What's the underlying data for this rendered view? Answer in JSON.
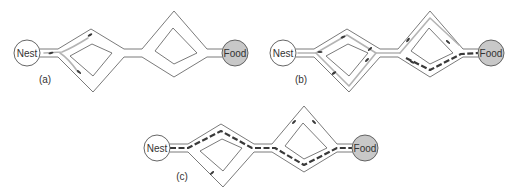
{
  "figure": {
    "panels": [
      {
        "id": "a",
        "label": "(a)",
        "nest_label": "Nest",
        "food_label": "Food",
        "trail_state": "exploration: few ants choosing branches at first junction",
        "ants_visible": 3
      },
      {
        "id": "b",
        "label": "(b)",
        "nest_label": "Nest",
        "food_label": "Food",
        "trail_state": "both branches explored; faint trails; heavy trail forming on lower branch of second diamond",
        "ants_visible": 8
      },
      {
        "id": "c",
        "label": "(c)",
        "nest_label": "Nest",
        "food_label": "Food",
        "trail_state": "converged: heavy dashed pheromone trail along shortest path (upper branch of first diamond, lower branch of second diamond)",
        "ants_visible": 3
      }
    ],
    "colors": {
      "wall": "#6b6b6b",
      "nest_fill": "#ffffff",
      "food_fill": "#c8c8c8",
      "light_trail": "#b4b4b4",
      "heavy_trail": "#3a3a3a",
      "background": "#ffffff"
    }
  }
}
